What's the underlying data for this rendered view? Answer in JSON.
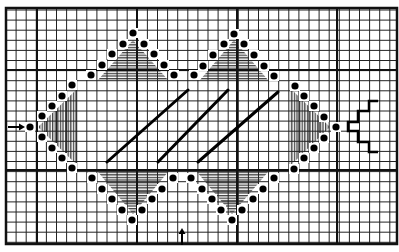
{
  "diagram": {
    "type": "needlepoint-stitch-chart",
    "canvas": {
      "width": 399,
      "height": 252,
      "background": "#ffffff"
    },
    "grid": {
      "x0": 6,
      "y0": 8,
      "x1": 397,
      "y1": 244,
      "pitch": 10.1,
      "thin_color": "#222222",
      "thin_width": 1,
      "major_x": [
        37,
        137,
        237,
        337
      ],
      "major_y": [
        70,
        170
      ],
      "major_width": 2,
      "border_width": 2.5,
      "border_color": "#111111"
    },
    "colors": {
      "ink": "#000000",
      "hatch": "#555555",
      "dot_halo": "#ffffff"
    },
    "dots": [
      [
        91,
        75
      ],
      [
        102,
        65
      ],
      [
        112,
        54
      ],
      [
        123,
        44
      ],
      [
        133,
        33
      ],
      [
        144,
        44
      ],
      [
        154,
        54
      ],
      [
        164,
        65
      ],
      [
        174,
        75
      ],
      [
        194,
        75
      ],
      [
        203,
        66
      ],
      [
        213,
        55
      ],
      [
        224,
        44
      ],
      [
        234,
        34
      ],
      [
        244,
        44
      ],
      [
        254,
        55
      ],
      [
        264,
        66
      ],
      [
        274,
        76
      ],
      [
        30,
        127
      ],
      [
        42,
        116
      ],
      [
        52,
        106
      ],
      [
        62,
        96
      ],
      [
        72,
        85
      ],
      [
        42,
        137
      ],
      [
        52,
        148
      ],
      [
        62,
        158
      ],
      [
        72,
        168
      ],
      [
        295,
        86
      ],
      [
        304,
        96
      ],
      [
        314,
        106
      ],
      [
        324,
        117
      ],
      [
        336,
        127
      ],
      [
        324,
        138
      ],
      [
        314,
        148
      ],
      [
        304,
        158
      ],
      [
        294,
        169
      ],
      [
        92,
        178
      ],
      [
        102,
        189
      ],
      [
        112,
        199
      ],
      [
        122,
        210
      ],
      [
        132,
        220
      ],
      [
        142,
        210
      ],
      [
        152,
        199
      ],
      [
        162,
        189
      ],
      [
        173,
        178
      ],
      [
        191,
        178
      ],
      [
        202,
        189
      ],
      [
        212,
        199
      ],
      [
        221,
        210
      ],
      [
        232,
        220
      ],
      [
        242,
        210
      ],
      [
        253,
        199
      ],
      [
        263,
        189
      ],
      [
        274,
        178
      ]
    ],
    "hatched_regions": [
      {
        "name": "top-left-triangle",
        "orientation": "horizontal",
        "points": "98,80 133,40 168,80"
      },
      {
        "name": "top-right-triangle",
        "orientation": "horizontal",
        "points": "200,80 234,40 268,80"
      },
      {
        "name": "left-triangle",
        "orientation": "vertical",
        "points": "38,127 78,88 78,166"
      },
      {
        "name": "right-triangle",
        "orientation": "vertical",
        "points": "290,88 330,127 290,166"
      },
      {
        "name": "bottom-left-triangle",
        "orientation": "horizontal",
        "points": "98,172 133,214 168,172"
      },
      {
        "name": "bottom-right-triangle",
        "orientation": "horizontal",
        "points": "197,172 232,214 268,172"
      }
    ],
    "diagonals": [
      {
        "x1": 107,
        "y1": 162,
        "x2": 188,
        "y2": 90
      },
      {
        "x1": 158,
        "y1": 162,
        "x2": 228,
        "y2": 90
      },
      {
        "x1": 198,
        "y1": 162,
        "x2": 278,
        "y2": 92
      }
    ],
    "zigzag": "378,101 369,101 369,111 358,111 358,122 348,122 348,131 358,131 358,142 369,142 369,152 378,152",
    "arrows": [
      {
        "name": "start-arrow-left",
        "direction": "right",
        "x1": 8,
        "y1": 127,
        "x2": 22,
        "y2": 127
      },
      {
        "name": "start-arrow-bottom",
        "direction": "up",
        "x1": 182,
        "y1": 245,
        "x2": 182,
        "y2": 231
      }
    ]
  }
}
